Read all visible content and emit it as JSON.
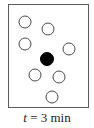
{
  "diagram": {
    "frame": {
      "x": 8,
      "y": 4,
      "width": 80,
      "height": 103,
      "stroke": "#5a5a5a"
    },
    "particles": [
      {
        "type": "open",
        "cx": 25,
        "cy": 22,
        "r": 6
      },
      {
        "type": "open",
        "cx": 48,
        "cy": 29,
        "r": 6
      },
      {
        "type": "open",
        "cx": 25,
        "cy": 44,
        "r": 6
      },
      {
        "type": "open",
        "cx": 69,
        "cy": 49,
        "r": 6
      },
      {
        "type": "filled",
        "cx": 47,
        "cy": 59,
        "r": 6
      },
      {
        "type": "open",
        "cx": 35,
        "cy": 75,
        "r": 6
      },
      {
        "type": "open",
        "cx": 59,
        "cy": 77,
        "r": 6
      },
      {
        "type": "open",
        "cx": 52,
        "cy": 97,
        "r": 6
      }
    ],
    "colors": {
      "open_stroke": "#4a4a4a",
      "filled": "#000000"
    },
    "label": {
      "variable": "t",
      "equals": " = ",
      "value": "3 min"
    }
  }
}
